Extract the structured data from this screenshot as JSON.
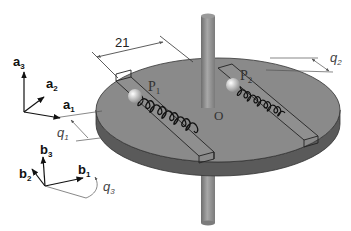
{
  "diagram": {
    "colors": {
      "disk_top": "#8a8a8a",
      "disk_side": "#5a5a5a",
      "shaft": "#8c8c8c",
      "spring": "#1a1a1a",
      "ball": "#d8d8d8",
      "lines": "#333333"
    },
    "frame_a": {
      "axes": [
        "a",
        "a",
        "a"
      ],
      "subscripts": [
        "3",
        "2",
        "1"
      ]
    },
    "frame_b": {
      "axes": [
        "b",
        "b",
        "b"
      ],
      "subscripts": [
        "3",
        "2",
        "1"
      ],
      "rotation_label": "q",
      "rotation_subscript": "3"
    },
    "dimension": {
      "label": "21"
    },
    "points": {
      "p1": {
        "letter": "P",
        "subscript": "1"
      },
      "p2": {
        "letter": "P",
        "subscript": "2"
      },
      "origin": "O"
    },
    "coordinates": {
      "q1": {
        "letter": "q",
        "subscript": "1"
      },
      "q2": {
        "letter": "q",
        "subscript": "2"
      }
    }
  }
}
